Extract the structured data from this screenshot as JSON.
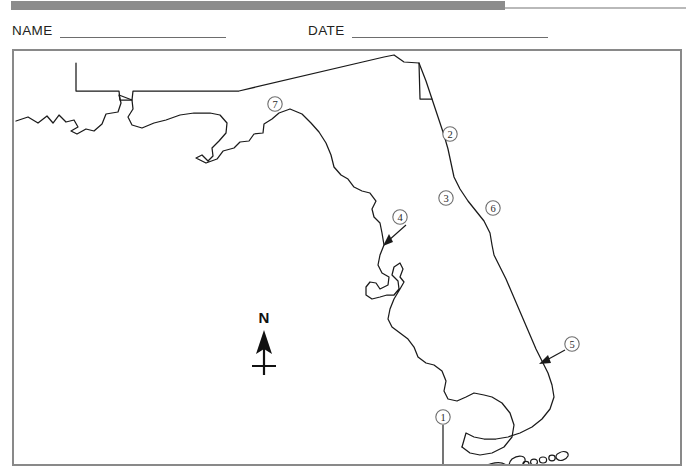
{
  "header": {
    "band_color": "#8c8c8c",
    "rule_color": "#b9b9b9"
  },
  "form": {
    "name_label": "NAME",
    "name_value": "",
    "name_placeholder": "",
    "date_label": "DATE",
    "date_value": "",
    "date_placeholder": ""
  },
  "map": {
    "title": "Florida outline map",
    "frame_color": "#898989",
    "outline_color": "#1a1a1a",
    "background": "#ffffff",
    "compass": {
      "label": "N",
      "name": "north-arrow"
    },
    "markers": [
      {
        "id": "1",
        "label": "1",
        "cx": 441,
        "cy": 415,
        "has_leader": true
      },
      {
        "id": "2",
        "label": "2",
        "cx": 448,
        "cy": 132,
        "has_leader": false
      },
      {
        "id": "3",
        "label": "3",
        "cx": 444,
        "cy": 196,
        "has_leader": false
      },
      {
        "id": "4",
        "label": "4",
        "cx": 398,
        "cy": 215,
        "has_leader": true
      },
      {
        "id": "5",
        "label": "5",
        "cx": 570,
        "cy": 342,
        "has_leader": true
      },
      {
        "id": "6",
        "label": "6",
        "cx": 491,
        "cy": 206,
        "has_leader": false
      },
      {
        "id": "7",
        "label": "7",
        "cx": 273,
        "cy": 102,
        "has_leader": false
      }
    ]
  }
}
